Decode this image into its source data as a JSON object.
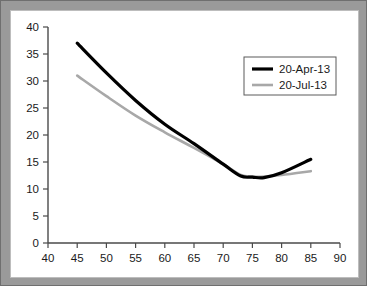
{
  "chart_data": {
    "type": "line",
    "title": "",
    "xlabel": "",
    "ylabel": "",
    "xlim": [
      40,
      90
    ],
    "ylim": [
      0,
      40
    ],
    "xticks": [
      40,
      45,
      50,
      55,
      60,
      65,
      70,
      75,
      80,
      85,
      90
    ],
    "yticks": [
      0,
      5,
      10,
      15,
      20,
      25,
      30,
      35,
      40
    ],
    "grid": false,
    "legend_position": "upper right",
    "x": [
      45,
      50,
      55,
      60,
      65,
      70,
      73,
      75,
      77,
      80,
      85
    ],
    "series": [
      {
        "name": "20-Apr-13",
        "color": "#000000",
        "linewidth": 3.2,
        "values": [
          37.0,
          31.5,
          26.4,
          22.0,
          18.4,
          14.6,
          12.4,
          12.2,
          12.1,
          13.0,
          15.5
        ]
      },
      {
        "name": "20-Jul-13",
        "color": "#a8a8a8",
        "linewidth": 2.6,
        "values": [
          31.0,
          27.2,
          23.6,
          20.5,
          17.6,
          14.6,
          12.6,
          12.3,
          12.3,
          12.6,
          13.3
        ]
      }
    ]
  },
  "legend": {
    "entries": [
      {
        "label": "20-Apr-13"
      },
      {
        "label": "20-Jul-13"
      }
    ]
  },
  "axis_labels": {
    "x": [
      "40",
      "45",
      "50",
      "55",
      "60",
      "65",
      "70",
      "75",
      "80",
      "85",
      "90"
    ],
    "y": [
      "0",
      "5",
      "10",
      "15",
      "20",
      "25",
      "30",
      "35",
      "40"
    ]
  },
  "colors": {
    "series_primary": "#000000",
    "series_secondary": "#a8a8a8",
    "axis": "#4a4a4a",
    "frame": "#9a9a9a",
    "plot_background": "#ffffff"
  }
}
